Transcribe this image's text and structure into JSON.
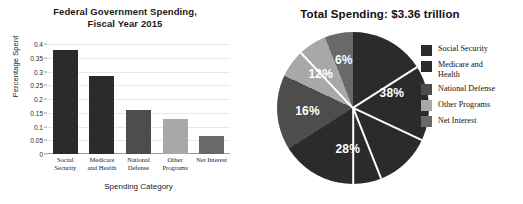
{
  "chart_data": [
    {
      "type": "bar",
      "title": "Federal Government Spending, Fiscal Year 2015",
      "title_lines": [
        "Federal Government Spending,",
        "Fiscal Year 2015"
      ],
      "xlabel": "Spending Category",
      "ylabel": "Percentage Spent",
      "categories": [
        "Social Security",
        "Medicare and Health",
        "National Defense",
        "Other Programs",
        "Net Interest"
      ],
      "category_lines": [
        [
          "Social",
          "Security"
        ],
        [
          "Medicare",
          "and Health"
        ],
        [
          "National",
          "Defense"
        ],
        [
          "Other",
          "Programs"
        ],
        [
          "Net Interest"
        ]
      ],
      "values": [
        0.38,
        0.283,
        0.16,
        0.127,
        0.065
      ],
      "colors": [
        "#2b2b2b",
        "#2b2b2b",
        "#4d4d4d",
        "#a8a8a8",
        "#696969"
      ],
      "ylim": [
        0,
        0.4
      ],
      "yticks": [
        0,
        0.05,
        0.1,
        0.15,
        0.2,
        0.25,
        0.3,
        0.35,
        0.4
      ],
      "ytick_labels": [
        "0",
        "0.05",
        "0.1",
        "0.15",
        "0.2",
        "0.25",
        "0.3",
        "0.35",
        "0.4"
      ],
      "grid": true,
      "legend": "none"
    },
    {
      "type": "pie",
      "title": "Total Spending: $3.36 trillion",
      "labels": [
        "Social Security",
        "Medicare and Health",
        "National Defense",
        "Other Programs",
        "Net Interest"
      ],
      "legend_lines": [
        [
          "Social Security"
        ],
        [
          "Medicare and",
          "Health"
        ],
        [
          "National Defense"
        ],
        [
          "Other Programs"
        ],
        [
          "Net Interest"
        ]
      ],
      "values": [
        38,
        28,
        16,
        12,
        6
      ],
      "value_labels": [
        "38%",
        "28%",
        "16%",
        "12%",
        "6%"
      ],
      "colors": [
        "#2b2b2b",
        "#2b2b2b",
        "#4d4d4d",
        "#a8a8a8",
        "#696969"
      ],
      "legend_position": "right",
      "start_angle_deg": 0,
      "direction": "clockwise"
    }
  ]
}
